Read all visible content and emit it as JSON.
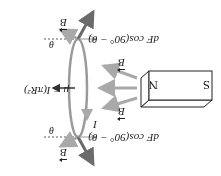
{
  "figure": {
    "orientation": "rotated 180 degrees",
    "magnet": {
      "north_label": "N",
      "south_label": "S"
    },
    "labels": {
      "b_field_top": "B",
      "b_field_bottom": "B",
      "b_field_left_top": "B",
      "b_field_left_bottom": "B",
      "force_component_top": "dF cos(90° − θ)",
      "force_component_bottom": "dF cos(90° − θ)",
      "theta_top": "θ",
      "theta_bottom": "θ",
      "current": "I",
      "magnetic_moment": "μ = I(πR²)"
    },
    "colors": {
      "field_arrow": "#a9a9a9",
      "force_arrow": "#6b6b6b",
      "loop": "#9a9a9a",
      "outline": "#222222"
    }
  }
}
